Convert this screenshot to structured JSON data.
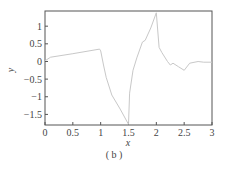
{
  "caption": "( b )",
  "chart_data": {
    "type": "line",
    "title": "",
    "xlabel": "x",
    "ylabel": "y",
    "xlim": [
      0,
      3
    ],
    "ylim": [
      -1.8,
      1.43
    ],
    "xticks": [
      0,
      0.5,
      1,
      1.5,
      2,
      2.5,
      3
    ],
    "xtick_labels": [
      "0",
      "0.5",
      "1",
      "1.5",
      "2",
      "2.5",
      "3"
    ],
    "yticks": [
      1,
      0.5,
      0,
      -0.5,
      -1,
      -1.5
    ],
    "ytick_labels": [
      "1",
      "0.5",
      "0",
      "-0.5",
      "-1",
      "-1.5"
    ],
    "grid": false,
    "legend": null,
    "line_color": "#c8c8c8",
    "series": [
      {
        "name": "y",
        "x": [
          0,
          0.1,
          0.5,
          0.98,
          1.0,
          1.05,
          1.1,
          1.2,
          1.35,
          1.5,
          1.52,
          1.58,
          1.65,
          1.75,
          1.8,
          1.9,
          2.0,
          2.05,
          2.1,
          2.2,
          2.25,
          2.3,
          2.4,
          2.5,
          2.6,
          2.75,
          2.85,
          3.0
        ],
        "y": [
          0.02,
          0.12,
          0.22,
          0.35,
          0.3,
          -0.1,
          -0.45,
          -0.95,
          -1.35,
          -1.78,
          -0.9,
          -0.25,
          0.1,
          0.55,
          0.6,
          0.95,
          1.38,
          0.4,
          0.25,
          0.0,
          -0.1,
          -0.05,
          -0.15,
          -0.25,
          -0.05,
          0.0,
          -0.02,
          -0.02
        ]
      }
    ]
  }
}
